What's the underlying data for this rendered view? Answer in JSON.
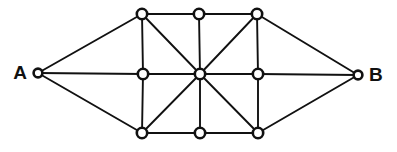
{
  "diagram": {
    "type": "node-link-graph",
    "width": 397,
    "height": 152,
    "background_color": "#ffffff",
    "edge_color": "#111111",
    "node_fill_color": "#ffffff",
    "node_stroke_color": "#111111",
    "label_color": "#111111",
    "node_radius": 5.2,
    "terminal_node_radius": 4.4,
    "edge_width": 1.9,
    "node_count": 11,
    "edge_count": 22,
    "nodes": [
      {
        "id": "A",
        "label": "A",
        "label_side": "left",
        "x": 38,
        "y": 73,
        "terminal": true
      },
      {
        "id": "B",
        "label": "B",
        "label_side": "right",
        "x": 358,
        "y": 75,
        "terminal": true
      },
      {
        "id": "TL",
        "label": "",
        "label_side": "none",
        "x": 142,
        "y": 14,
        "terminal": false
      },
      {
        "id": "TM",
        "label": "",
        "label_side": "none",
        "x": 199,
        "y": 14,
        "terminal": false
      },
      {
        "id": "TR",
        "label": "",
        "label_side": "none",
        "x": 257,
        "y": 14,
        "terminal": false
      },
      {
        "id": "ML",
        "label": "",
        "label_side": "none",
        "x": 143,
        "y": 74,
        "terminal": false
      },
      {
        "id": "C",
        "label": "",
        "label_side": "none",
        "x": 200,
        "y": 74,
        "terminal": false
      },
      {
        "id": "MR",
        "label": "",
        "label_side": "none",
        "x": 258,
        "y": 74,
        "terminal": false
      },
      {
        "id": "BL",
        "label": "",
        "label_side": "none",
        "x": 142,
        "y": 133,
        "terminal": false
      },
      {
        "id": "BM",
        "label": "",
        "label_side": "none",
        "x": 200,
        "y": 133,
        "terminal": false
      },
      {
        "id": "BR",
        "label": "",
        "label_side": "none",
        "x": 258,
        "y": 133,
        "terminal": false
      }
    ],
    "edges": [
      {
        "from": "A",
        "to": "TL"
      },
      {
        "from": "A",
        "to": "ML"
      },
      {
        "from": "A",
        "to": "BL"
      },
      {
        "from": "TL",
        "to": "TM"
      },
      {
        "from": "TM",
        "to": "TR"
      },
      {
        "from": "ML",
        "to": "C"
      },
      {
        "from": "C",
        "to": "MR"
      },
      {
        "from": "BL",
        "to": "BM"
      },
      {
        "from": "BM",
        "to": "BR"
      },
      {
        "from": "TL",
        "to": "ML"
      },
      {
        "from": "ML",
        "to": "BL"
      },
      {
        "from": "TM",
        "to": "C"
      },
      {
        "from": "C",
        "to": "BM"
      },
      {
        "from": "TR",
        "to": "MR"
      },
      {
        "from": "MR",
        "to": "BR"
      },
      {
        "from": "TL",
        "to": "C"
      },
      {
        "from": "TR",
        "to": "C"
      },
      {
        "from": "C",
        "to": "BL"
      },
      {
        "from": "C",
        "to": "BR"
      },
      {
        "from": "TR",
        "to": "B"
      },
      {
        "from": "MR",
        "to": "B"
      },
      {
        "from": "BR",
        "to": "B"
      }
    ]
  }
}
